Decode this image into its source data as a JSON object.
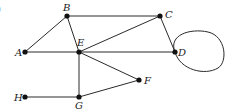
{
  "diagram": {
    "type": "graph",
    "corner_fragment": ")",
    "nodes": [
      {
        "id": "A",
        "label": "A",
        "x": 25,
        "y": 52,
        "lx": 15,
        "ly": 56
      },
      {
        "id": "B",
        "label": "B",
        "x": 67,
        "y": 16,
        "lx": 63,
        "ly": 11
      },
      {
        "id": "C",
        "label": "C",
        "x": 160,
        "y": 16,
        "lx": 165,
        "ly": 18
      },
      {
        "id": "D",
        "label": "D",
        "x": 175,
        "y": 52,
        "lx": 178,
        "ly": 56
      },
      {
        "id": "E",
        "label": "E",
        "x": 79,
        "y": 52,
        "lx": 77,
        "ly": 46
      },
      {
        "id": "F",
        "label": "F",
        "x": 139,
        "y": 80,
        "lx": 144,
        "ly": 84
      },
      {
        "id": "G",
        "label": "G",
        "x": 79,
        "y": 97,
        "lx": 75,
        "ly": 109
      },
      {
        "id": "H",
        "label": "H",
        "x": 25,
        "y": 97,
        "lx": 14,
        "ly": 101
      }
    ],
    "edges": [
      {
        "from": "A",
        "to": "B"
      },
      {
        "from": "A",
        "to": "D"
      },
      {
        "from": "B",
        "to": "C"
      },
      {
        "from": "B",
        "to": "E"
      },
      {
        "from": "C",
        "to": "E"
      },
      {
        "from": "C",
        "to": "D"
      },
      {
        "from": "E",
        "to": "F"
      },
      {
        "from": "E",
        "to": "G"
      },
      {
        "from": "F",
        "to": "G"
      },
      {
        "from": "H",
        "to": "G"
      }
    ],
    "loops": [
      {
        "node": "D",
        "path": "M175,52 C168,35 190,28 208,32 C226,36 228,62 218,68 C205,76 180,70 175,52"
      }
    ]
  }
}
